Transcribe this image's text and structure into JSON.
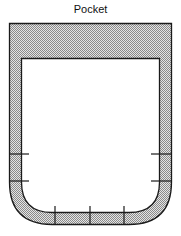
{
  "diagram": {
    "title": "Pocket",
    "colors": {
      "stroke": "#1a1a1a",
      "fill_pattern_dark": "#9a9a9a",
      "fill_pattern_light": "#e6e6e6",
      "inner": "#ffffff"
    }
  }
}
